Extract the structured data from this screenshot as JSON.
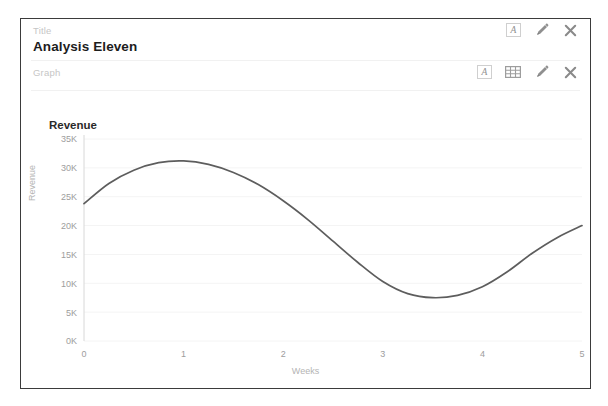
{
  "card": {
    "title_field": {
      "label": "Title",
      "value": "Analysis Eleven",
      "actions": [
        {
          "name": "annotate-text-icon",
          "glyph": "A"
        },
        {
          "name": "edit-pencil-icon",
          "glyph": "pencil"
        },
        {
          "name": "close-icon",
          "glyph": "x"
        }
      ]
    },
    "graph_field": {
      "label": "Graph",
      "actions": [
        {
          "name": "annotate-text-icon",
          "glyph": "A"
        },
        {
          "name": "data-table-icon",
          "glyph": "grid"
        },
        {
          "name": "edit-pencil-icon",
          "glyph": "pencil"
        },
        {
          "name": "close-icon",
          "glyph": "x"
        }
      ]
    }
  },
  "colors": {
    "line": "#5d5d5d",
    "grid": "#f4f4f4",
    "axis": "#d8d8d8",
    "label_muted": "#b4b4b4",
    "tick": "#9d9d9d",
    "border": "#3b3b3b"
  },
  "chart_data": {
    "type": "line",
    "title": "Revenue",
    "xlabel": "Weeks",
    "ylabel": "Revenue",
    "grid": true,
    "legend": false,
    "xlim": [
      0,
      5
    ],
    "ylim": [
      0,
      35000
    ],
    "xticks": [
      0,
      1,
      2,
      3,
      4,
      5
    ],
    "xtick_labels": [
      "0",
      "1",
      "2",
      "3",
      "4",
      "5"
    ],
    "yticks": [
      0,
      5000,
      10000,
      15000,
      20000,
      25000,
      30000,
      35000
    ],
    "ytick_labels": [
      "0K",
      "5K",
      "10K",
      "15K",
      "20K",
      "25K",
      "30K",
      "35K"
    ],
    "series": [
      {
        "name": "Revenue",
        "x": [
          0,
          0.25,
          0.5,
          0.75,
          1,
          1.25,
          1.5,
          1.75,
          2,
          2.25,
          2.5,
          2.75,
          3,
          3.25,
          3.5,
          3.75,
          4,
          4.25,
          4.5,
          4.75,
          5
        ],
        "values": [
          23800,
          27300,
          29600,
          30900,
          31200,
          30600,
          29200,
          27100,
          24300,
          21000,
          17300,
          13600,
          10300,
          8200,
          7500,
          7900,
          9400,
          12000,
          15200,
          17900,
          20000
        ]
      }
    ]
  }
}
